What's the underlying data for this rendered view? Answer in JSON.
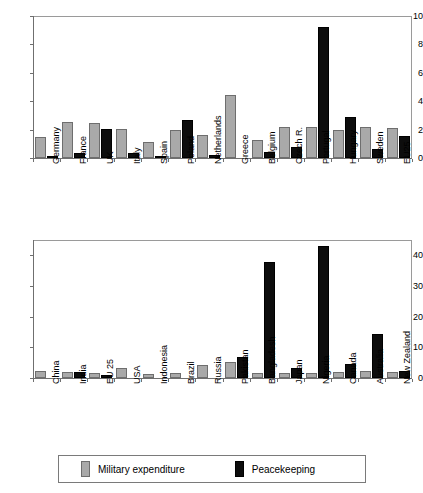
{
  "chart_data": [
    {
      "type": "bar",
      "title": "",
      "xlabel": "",
      "ylabel": "",
      "ylim": [
        0,
        10
      ],
      "yticks": [
        0,
        2,
        4,
        6,
        8,
        10
      ],
      "grid": false,
      "legend_position": "bottom",
      "categories": [
        "Germany",
        "France",
        "UK",
        "Italy",
        "Spain",
        "Poland",
        "Netherlands",
        "Greece",
        "Belgium",
        "Czech R.",
        "Portugal",
        "Hungary",
        "Sweden",
        "EU25"
      ],
      "series": [
        {
          "name": "Military expenditure",
          "color": "#a9a9a9",
          "values": [
            1.45,
            2.55,
            2.45,
            2.05,
            1.1,
            1.95,
            1.65,
            4.45,
            1.3,
            2.15,
            2.15,
            1.95,
            2.15,
            2.1
          ]
        },
        {
          "name": "Peacekeeping",
          "color": "#0d0d0d",
          "values": [
            0.1,
            0.35,
            2.05,
            0.35,
            0.1,
            2.7,
            0.2,
            0,
            0.4,
            0.8,
            9.2,
            2.9,
            0.65,
            1.55
          ]
        }
      ]
    },
    {
      "type": "bar",
      "title": "",
      "xlabel": "",
      "ylabel": "",
      "ylim": [
        0,
        45
      ],
      "yticks": [
        0,
        10,
        20,
        30,
        40
      ],
      "grid": false,
      "legend_position": "bottom",
      "categories": [
        "China",
        "India",
        "EU 25",
        "USA",
        "Indonesia",
        "Brazil",
        "Russia",
        "Pakistan",
        "Bangladesh",
        "Japan",
        "Nigeria",
        "Canada",
        "Australia",
        "New Zealand"
      ],
      "series": [
        {
          "name": "Military expenditure",
          "color": "#a9a9a9",
          "values": [
            2.4,
            2.0,
            1.5,
            3.2,
            1.4,
            1.7,
            4.2,
            5.1,
            1.6,
            1.7,
            1.7,
            1.8,
            2.2,
            1.8
          ]
        },
        {
          "name": "Peacekeeping",
          "color": "#0d0d0d",
          "values": [
            0,
            2.0,
            1.0,
            0,
            0,
            0,
            0,
            7.0,
            37.8,
            3.2,
            42.9,
            4.5,
            14.2,
            2.2
          ]
        }
      ]
    }
  ],
  "legend": {
    "military_label": "Military expenditure",
    "peacekeeping_label": "Peacekeeping",
    "military_color": "#a9a9a9",
    "peacekeeping_color": "#0d0d0d"
  }
}
